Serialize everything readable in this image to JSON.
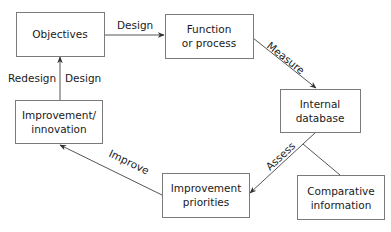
{
  "nodes": {
    "objectives": {
      "lines": [
        "Objectives"
      ]
    },
    "function": {
      "lines": [
        "Function",
        "or process"
      ]
    },
    "internal_db": {
      "lines": [
        "Internal",
        "database"
      ]
    },
    "comparative": {
      "lines": [
        "Comparative",
        "information"
      ]
    },
    "priorities": {
      "lines": [
        "Improvement",
        "priorities"
      ]
    },
    "innovation": {
      "lines": [
        "Improvement/",
        "innovation"
      ]
    }
  },
  "edges": {
    "design_top": {
      "label": "Design",
      "from": "objectives",
      "to": "function"
    },
    "measure": {
      "label": "Measure",
      "from": "function",
      "to": "internal_db"
    },
    "assess": {
      "label": "Assess",
      "from": "internal_db",
      "to": "priorities"
    },
    "comparative_link": {
      "label": "",
      "from": "comparative",
      "to": "assess"
    },
    "improve": {
      "label": "Improve",
      "from": "priorities",
      "to": "innovation"
    },
    "redesign_design": {
      "label_left": "Redesign",
      "label_right": "Design",
      "from": "innovation",
      "to": "objectives"
    }
  }
}
